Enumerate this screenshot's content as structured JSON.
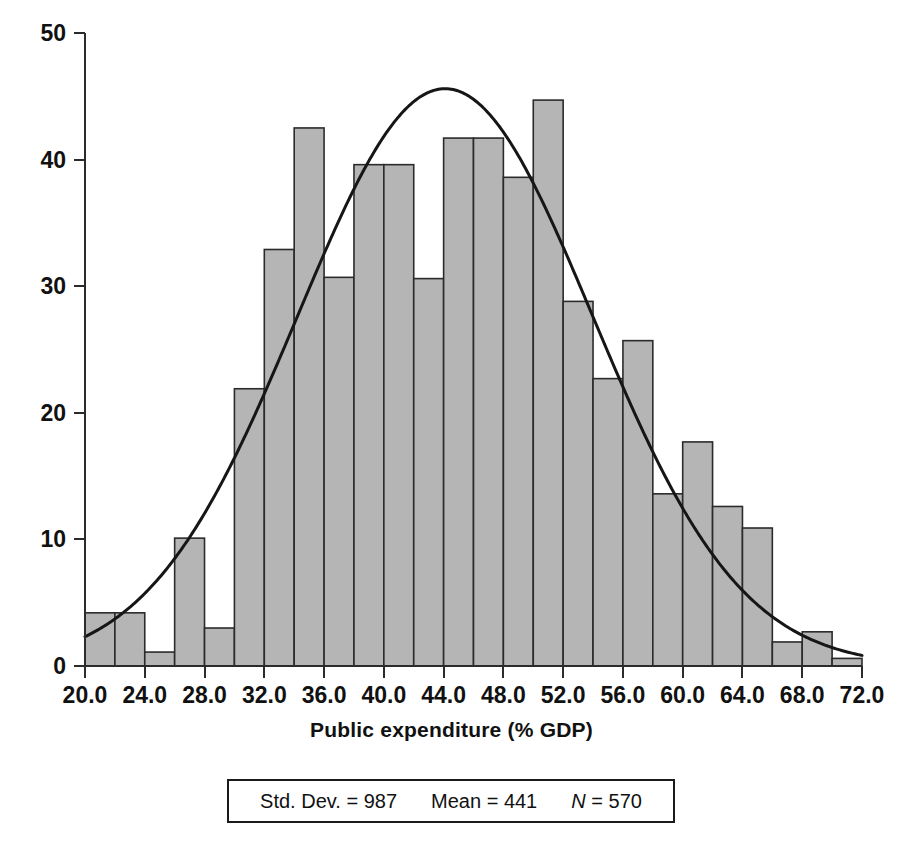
{
  "chart_data": {
    "type": "bar",
    "title": "",
    "subtitle": "",
    "xlabel": "Public expenditure (% GDP)",
    "ylabel": "",
    "xlim": [
      20.0,
      72.0
    ],
    "ylim": [
      0,
      50
    ],
    "grid": false,
    "legend": "none",
    "bin_width": 2.0,
    "x_tick_labels": [
      "20.0",
      "24.0",
      "28.0",
      "32.0",
      "36.0",
      "40.0",
      "44.0",
      "48.0",
      "52.0",
      "56.0",
      "60.0",
      "64.0",
      "68.0",
      "72.0"
    ],
    "x_tick_values": [
      20.0,
      24.0,
      28.0,
      32.0,
      36.0,
      40.0,
      44.0,
      48.0,
      52.0,
      56.0,
      60.0,
      64.0,
      68.0,
      72.0
    ],
    "y_tick_labels": [
      "0",
      "10",
      "20",
      "30",
      "40",
      "50"
    ],
    "y_tick_values": [
      0,
      10,
      20,
      30,
      40,
      50
    ],
    "bin_starts": [
      20,
      22,
      24,
      26,
      28,
      30,
      32,
      34,
      36,
      38,
      40,
      42,
      44,
      46,
      48,
      50,
      52,
      54,
      56,
      58,
      60,
      62,
      64,
      66,
      68,
      70
    ],
    "categories": [
      "20-22",
      "22-24",
      "24-26",
      "26-28",
      "28-30",
      "30-32",
      "32-34",
      "34-36",
      "36-38",
      "38-40",
      "40-42",
      "42-44",
      "44-46",
      "46-48",
      "48-50",
      "50-52",
      "52-54",
      "54-56",
      "56-58",
      "58-60",
      "60-62",
      "62-64",
      "64-66",
      "66-68",
      "68-70",
      "70-72"
    ],
    "values": [
      4.2,
      4.2,
      1.1,
      10.1,
      3.0,
      21.9,
      32.9,
      42.5,
      30.7,
      39.6,
      39.6,
      30.6,
      41.7,
      41.7,
      38.6,
      44.7,
      28.8,
      22.7,
      25.7,
      13.6,
      17.7,
      12.6,
      10.9,
      1.9,
      2.7,
      0.6
    ],
    "overlay_curve": {
      "type": "normal",
      "label": "normal curve",
      "peak_x": 44.0,
      "peak_y": 45.6,
      "start_x": 20.0,
      "start_y": 1.5,
      "end_x": 72.0,
      "end_y": 0.45,
      "mean": 44.1,
      "sigma": 9.87
    },
    "annotations": {
      "stats_box": {
        "std_dev_label": "Std. Dev. =",
        "std_dev_value": "987",
        "mean_label": "Mean =",
        "mean_value": "441",
        "n_symbol": "N",
        "n_equals": "=",
        "n_value": "570"
      }
    }
  },
  "axis": {
    "xlabel": "Public expenditure (% GDP)"
  }
}
